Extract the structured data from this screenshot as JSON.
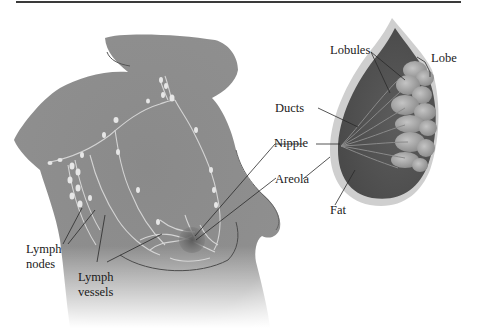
{
  "figure": {
    "colors": {
      "skin": "#8c8c8c",
      "skin_dark": "#6e6e6e",
      "vessel": "#d9d9d9",
      "lobule": "#a9a9a9",
      "fat": "#5e5e5e",
      "rule": "#3a3a3a"
    },
    "labels": {
      "lobules": "Lobules",
      "lobe": "Lobe",
      "ducts": "Ducts",
      "nipple": "Nipple",
      "areola": "Areola",
      "fat": "Fat",
      "lymph_nodes_line1": "Lymph",
      "lymph_nodes_line2": "nodes",
      "lymph_vessels_line1": "Lymph",
      "lymph_vessels_line2": "vessels"
    }
  }
}
